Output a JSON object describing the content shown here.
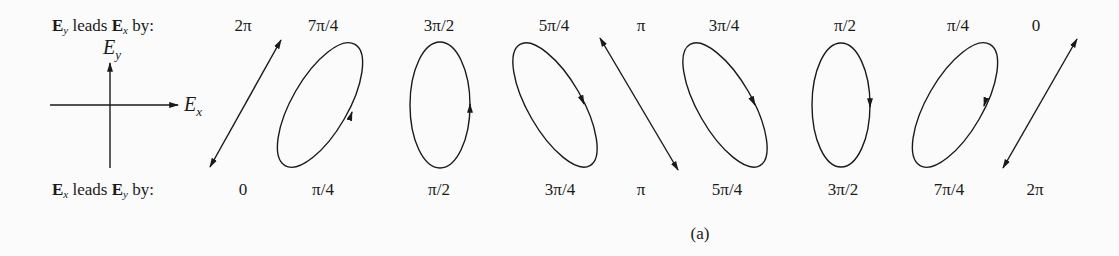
{
  "rows": {
    "top": {
      "prefix_a": "E",
      "sub_a": "y",
      "mid": " leads ",
      "prefix_b": "E",
      "sub_b": "x",
      "suffix": " by:"
    },
    "bottom": {
      "prefix_a": "E",
      "sub_a": "x",
      "mid": " leads ",
      "prefix_b": "E",
      "sub_b": "y",
      "suffix": " by:"
    }
  },
  "axes": {
    "x_label": "E",
    "x_sub": "x",
    "y_label": "E",
    "y_sub": "y"
  },
  "columns": [
    {
      "top": "2π",
      "bottom": "0",
      "shape": "line-positive"
    },
    {
      "top": "7π/4",
      "bottom": "π/4",
      "shape": "ellipse-right-tilt"
    },
    {
      "top": "3π/2",
      "bottom": "π/2",
      "shape": "ellipse-vertical"
    },
    {
      "top": "5π/4",
      "bottom": "3π/4",
      "shape": "ellipse-left-tilt"
    },
    {
      "top": "π",
      "bottom": "π",
      "shape": "line-negative"
    },
    {
      "top": "3π/4",
      "bottom": "5π/4",
      "shape": "ellipse-left-tilt"
    },
    {
      "top": "π/2",
      "bottom": "3π/2",
      "shape": "ellipse-vertical"
    },
    {
      "top": "π/4",
      "bottom": "7π/4",
      "shape": "ellipse-right-tilt"
    },
    {
      "top": "0",
      "bottom": "2π",
      "shape": "line-positive"
    }
  ],
  "caption": "(a)"
}
